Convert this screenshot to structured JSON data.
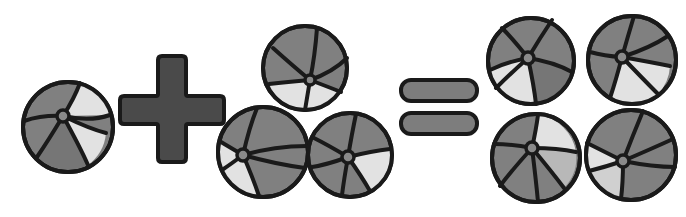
{
  "canvas": {
    "width": 686,
    "height": 217,
    "background": "#ffffff",
    "description": "Visual arithmetic equation with beach balls"
  },
  "palette": {
    "outline": "#1a1a1a",
    "mid_gray": "#808080",
    "dark_gray": "#767676",
    "light_gray": "#e2e2e2",
    "operator_fill": "#4a4a4a",
    "equals_fill": "#7d7d7d",
    "hub_fill": "#8a8a8a",
    "background": "#ffffff"
  },
  "equation": {
    "left_count": 1,
    "right_addend_count": 3,
    "result_count": 4,
    "expression": "1 + 3 = 4",
    "plus_label": "plus",
    "equals_label": "equals"
  },
  "groups": [
    {
      "name": "addend-one",
      "count": 1,
      "label": "1",
      "balls": [
        {
          "id": "ball-a1",
          "cx": 68,
          "cy": 127,
          "r": 45,
          "hub_dx": -5,
          "hub_dy": -11,
          "hub_r": 6,
          "rotation": -18,
          "segments": [
            "mid",
            "light",
            "mid",
            "dark",
            "mid"
          ],
          "spoke_angles": [
            18,
            78,
            150,
            232,
            300
          ]
        }
      ]
    },
    {
      "name": "plus-operator",
      "count": 0,
      "label": "+"
    },
    {
      "name": "addend-three",
      "count": 3,
      "label": "3",
      "balls": [
        {
          "id": "ball-b1",
          "cx": 305,
          "cy": 68,
          "r": 42,
          "hub_dx": 5,
          "hub_dy": 12,
          "hub_r": 5,
          "rotation": 24,
          "segments": [
            "dark",
            "dark",
            "light",
            "light",
            "dark"
          ],
          "spoke_angles": [
            8,
            70,
            132,
            205,
            288
          ]
        },
        {
          "id": "ball-b2",
          "cx": 263,
          "cy": 152,
          "r": 45,
          "hub_dx": -20,
          "hub_dy": 3,
          "hub_r": 6,
          "rotation": -40,
          "segments": [
            "mid",
            "mid",
            "light",
            "light",
            "mid"
          ],
          "spoke_angles": [
            2,
            66,
            140,
            212,
            292
          ]
        },
        {
          "id": "ball-b3",
          "cx": 350,
          "cy": 155,
          "r": 42,
          "hub_dx": -2,
          "hub_dy": 2,
          "hub_r": 6,
          "rotation": 10,
          "segments": [
            "mid",
            "light",
            "mid",
            "mid",
            "mid"
          ],
          "spoke_angles": [
            30,
            95,
            165,
            240,
            310
          ]
        }
      ]
    },
    {
      "name": "equals-operator",
      "count": 0,
      "label": "="
    },
    {
      "name": "sum-four",
      "count": 4,
      "label": "4",
      "balls": [
        {
          "id": "ball-c1",
          "cx": 530,
          "cy": 60,
          "r": 43,
          "hub_dx": -3,
          "hub_dy": -3,
          "hub_r": 6,
          "rotation": -8,
          "segments": [
            "mid",
            "mid",
            "light",
            "light",
            "mid"
          ],
          "spoke_angles": [
            22,
            88,
            158,
            226,
            300
          ]
        },
        {
          "id": "ball-c2",
          "cx": 632,
          "cy": 60,
          "r": 44,
          "hub_dx": -10,
          "hub_dy": -3,
          "hub_r": 6,
          "rotation": 12,
          "segments": [
            "mid",
            "mid",
            "light",
            "light",
            "mid"
          ],
          "spoke_angles": [
            10,
            72,
            150,
            220,
            295
          ]
        },
        {
          "id": "ball-c3",
          "cx": 534,
          "cy": 156,
          "r": 44,
          "hub_dx": -4,
          "hub_dy": -10,
          "hub_r": 6,
          "rotation": -5,
          "segments": [
            "light",
            "mid",
            "mid",
            "mid",
            "mid"
          ],
          "spoke_angles": [
            25,
            95,
            168,
            242,
            312
          ]
        },
        {
          "id": "ball-c4",
          "cx": 631,
          "cy": 155,
          "r": 45,
          "hub_dx": -8,
          "hub_dy": 6,
          "hub_r": 6,
          "rotation": 18,
          "segments": [
            "mid",
            "mid",
            "mid",
            "light",
            "light"
          ],
          "spoke_angles": [
            15,
            80,
            150,
            218,
            288
          ]
        }
      ]
    }
  ],
  "plus_sign": {
    "name": "plus-sign",
    "cx": 172,
    "cy": 110,
    "arm_length": 52,
    "arm_thickness": 30,
    "corner_radius": 14
  },
  "equals_sign": {
    "name": "equals-sign",
    "cx": 437,
    "bar_width": 72,
    "bar_height": 19,
    "bar_radius": 9,
    "top_bar_y": 84,
    "bottom_bar_y": 115
  }
}
